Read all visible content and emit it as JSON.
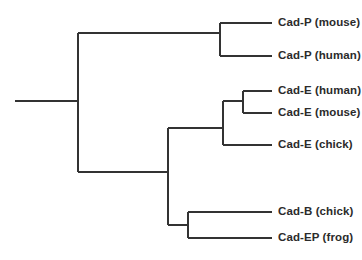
{
  "diagram": {
    "type": "phylogenetic-cladogram",
    "title": "",
    "line_color": "#333333",
    "line_width": 2,
    "text_color": "#2b2b2b",
    "background": "#ffffff",
    "orientation": "left-to-right"
  },
  "tips": [
    {
      "id": "cad-p-mouse",
      "label": "Cad-P (mouse)",
      "x": 272,
      "y": 23,
      "branch_from_x": 220,
      "label_x": 278
    },
    {
      "id": "cad-p-human",
      "label": "Cad-P (human)",
      "x": 272,
      "y": 56,
      "branch_from_x": 220,
      "label_x": 278
    },
    {
      "id": "cad-e-human",
      "label": "Cad-E (human)",
      "x": 272,
      "y": 91,
      "branch_from_x": 243,
      "label_x": 278
    },
    {
      "id": "cad-e-mouse",
      "label": "Cad-E (mouse)",
      "x": 272,
      "y": 113,
      "branch_from_x": 243,
      "label_x": 278
    },
    {
      "id": "cad-e-chick",
      "label": "Cad-E (chick)",
      "x": 272,
      "y": 145,
      "branch_from_x": 223,
      "label_x": 278
    },
    {
      "id": "cad-b-chick",
      "label": "Cad-B (chick)",
      "x": 272,
      "y": 212,
      "branch_from_x": 188,
      "label_x": 278
    },
    {
      "id": "cad-ep-frog",
      "label": "Cad-EP (frog)",
      "x": 272,
      "y": 238,
      "branch_from_x": 188,
      "label_x": 278
    }
  ],
  "nodes": [
    {
      "id": "root-stem",
      "name": "root-stem",
      "x1": 15,
      "y1": 101,
      "x2": 78,
      "y2": 101
    },
    {
      "id": "root-vertical",
      "name": "root-split-vertical",
      "x1": 78,
      "y1": 33,
      "x2": 78,
      "y2": 172
    },
    {
      "id": "p-branch",
      "name": "cad-p-clade-branch",
      "x1": 78,
      "y1": 33,
      "x2": 220,
      "y2": 33
    },
    {
      "id": "p-vertical",
      "name": "cad-p-node-vertical",
      "x1": 220,
      "y1": 23,
      "x2": 220,
      "y2": 56
    },
    {
      "id": "lower-branch",
      "name": "lower-clade-branch",
      "x1": 78,
      "y1": 172,
      "x2": 168,
      "y2": 172
    },
    {
      "id": "lower-vertical",
      "name": "lower-node-vertical",
      "x1": 168,
      "y1": 128,
      "x2": 168,
      "y2": 225
    },
    {
      "id": "e-branch",
      "name": "cad-e-clade-branch",
      "x1": 168,
      "y1": 128,
      "x2": 223,
      "y2": 128
    },
    {
      "id": "e-vertical",
      "name": "cad-e-node-vertical",
      "x1": 223,
      "y1": 101,
      "x2": 223,
      "y2": 145
    },
    {
      "id": "e-inner-branch",
      "name": "cad-e-inner-branch",
      "x1": 223,
      "y1": 101,
      "x2": 243,
      "y2": 101
    },
    {
      "id": "e-inner-vert",
      "name": "cad-e-inner-vertical",
      "x1": 243,
      "y1": 91,
      "x2": 243,
      "y2": 113
    },
    {
      "id": "bep-branch",
      "name": "cad-b-ep-branch",
      "x1": 168,
      "y1": 225,
      "x2": 188,
      "y2": 225
    },
    {
      "id": "bep-vertical",
      "name": "cad-b-ep-vertical",
      "x1": 188,
      "y1": 212,
      "x2": 188,
      "y2": 238
    }
  ]
}
